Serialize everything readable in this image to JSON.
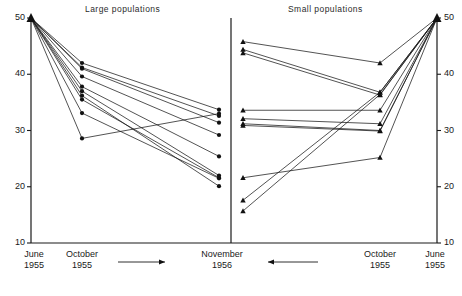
{
  "figure": {
    "width": 462,
    "height": 296,
    "background": "#ffffff",
    "line_color": "#1a1a1a",
    "marker_color": "#111111"
  },
  "panels": [
    {
      "key": "large",
      "title": "Large populations",
      "marker": "circle",
      "x_labels": [
        {
          "line1": "June",
          "line2": "1955"
        },
        {
          "line1": "October",
          "line2": "1955"
        },
        {
          "line1": "November",
          "line2": "1956"
        }
      ],
      "arrow_direction": "right"
    },
    {
      "key": "small",
      "title": "Small populations",
      "marker": "triangle",
      "x_labels": [
        {
          "line1": "November",
          "line2": "1956"
        },
        {
          "line1": "October",
          "line2": "1955"
        },
        {
          "line1": "June",
          "line2": "1955"
        }
      ],
      "arrow_direction": "left"
    }
  ],
  "axis": {
    "ticks": [
      50,
      40,
      30,
      20,
      10
    ],
    "ymin": 10,
    "ymax": 50,
    "left_axis_labels": [
      "50",
      "40",
      "30",
      "20",
      "10"
    ],
    "right_axis_labels": [
      "50",
      "40",
      "30",
      "20",
      "10"
    ]
  },
  "chart_data": {
    "type": "line",
    "title": "",
    "subtitle": "",
    "xlabel": "",
    "ylabel": "",
    "ylim": [
      10,
      50
    ],
    "grid": false,
    "legend": "none",
    "panels": [
      {
        "name": "Large populations",
        "marker": "circle",
        "x": [
          "June 1955",
          "October 1955",
          "November 1956"
        ],
        "series": [
          {
            "name": "L1",
            "values": [
              50,
              42.0,
              33.7
            ]
          },
          {
            "name": "L2",
            "values": [
              50,
              41.2,
              32.6
            ]
          },
          {
            "name": "L3",
            "values": [
              50,
              41.0,
              31.4
            ]
          },
          {
            "name": "L4",
            "values": [
              50,
              39.6,
              29.2
            ]
          },
          {
            "name": "L5",
            "values": [
              50,
              37.8,
              25.4
            ]
          },
          {
            "name": "L6",
            "values": [
              50,
              37.0,
              22.0
            ]
          },
          {
            "name": "L7",
            "values": [
              50,
              35.5,
              21.6
            ]
          },
          {
            "name": "L8",
            "values": [
              50,
              33.1,
              21.5
            ]
          },
          {
            "name": "L9",
            "values": [
              50,
              28.6,
              33.0
            ]
          },
          {
            "name": "L10",
            "values": [
              50,
              36.2,
              20.1
            ]
          }
        ]
      },
      {
        "name": "Small populations",
        "marker": "triangle",
        "x": [
          "November 1956",
          "October 1955",
          "June 1955"
        ],
        "series": [
          {
            "name": "S1",
            "values": [
              45.8,
              42.0,
              50
            ]
          },
          {
            "name": "S2",
            "values": [
              44.4,
              36.8,
              50
            ]
          },
          {
            "name": "S3",
            "values": [
              43.8,
              36.3,
              50
            ]
          },
          {
            "name": "S4",
            "values": [
              33.6,
              33.6,
              50
            ]
          },
          {
            "name": "S5",
            "values": [
              32.1,
              31.2,
              50
            ]
          },
          {
            "name": "S6",
            "values": [
              31.2,
              30.0,
              50
            ]
          },
          {
            "name": "S7",
            "values": [
              30.9,
              29.9,
              50
            ]
          },
          {
            "name": "S8",
            "values": [
              21.6,
              25.2,
              50
            ]
          },
          {
            "name": "S9",
            "values": [
              17.6,
              36.8,
              50
            ]
          },
          {
            "name": "S10",
            "values": [
              15.7,
              36.4,
              50
            ]
          }
        ]
      }
    ]
  }
}
